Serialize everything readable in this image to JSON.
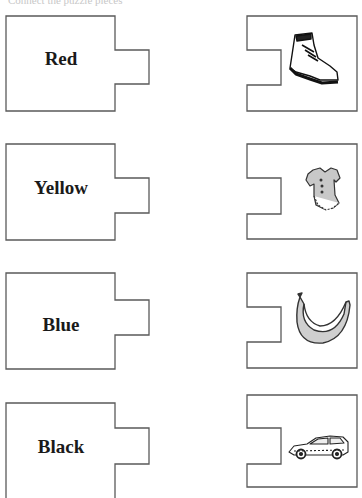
{
  "header": {
    "clipped_text": "Connect the puzzle pieces"
  },
  "left_pieces": [
    {
      "word": "Red"
    },
    {
      "word": "Yellow"
    },
    {
      "word": "Blue"
    },
    {
      "word": "Black"
    }
  ],
  "right_pieces": [
    {
      "picture": "boot-icon"
    },
    {
      "picture": "dress-icon"
    },
    {
      "picture": "banana-icon"
    },
    {
      "picture": "car-icon"
    }
  ],
  "colors": {
    "outline": "#5a5a5a",
    "text": "#1a1a1a",
    "fill_gray": "#c8c8c8"
  }
}
